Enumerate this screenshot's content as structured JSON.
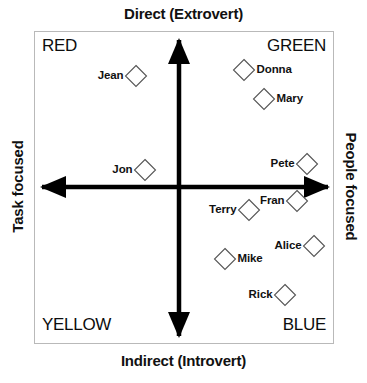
{
  "chart_data": {
    "type": "scatter",
    "title": "",
    "xlabel": "",
    "ylabel": "",
    "xlim": [
      0,
      367
    ],
    "ylim": [
      0,
      383
    ],
    "grid": false,
    "legend": "none",
    "axis_titles": {
      "top": "Direct (Extrovert)",
      "bottom": "Indirect (Introvert)",
      "left": "Task focused",
      "right": "People focused"
    },
    "quadrants": [
      {
        "name": "top-left",
        "label": "RED"
      },
      {
        "name": "top-right",
        "label": "GREEN"
      },
      {
        "name": "bottom-left",
        "label": "YELLOW"
      },
      {
        "name": "bottom-right",
        "label": "BLUE"
      }
    ],
    "origin": {
      "x": 179,
      "y": 187
    },
    "marker_shape": "diamond",
    "marker_size": 21,
    "points": [
      {
        "name": "Jean",
        "x": 136,
        "y": 76,
        "label_side": "left",
        "quadrant": "RED"
      },
      {
        "name": "Donna",
        "x": 244,
        "y": 70,
        "label_side": "right",
        "quadrant": "GREEN"
      },
      {
        "name": "Mary",
        "x": 264,
        "y": 99,
        "label_side": "right",
        "quadrant": "GREEN"
      },
      {
        "name": "Jon",
        "x": 145,
        "y": 170,
        "label_side": "left",
        "quadrant": "RED"
      },
      {
        "name": "Pete",
        "x": 307,
        "y": 164,
        "label_side": "left",
        "quadrant": "GREEN"
      },
      {
        "name": "Fran",
        "x": 297,
        "y": 201,
        "label_side": "left",
        "quadrant": "BLUE"
      },
      {
        "name": "Terry",
        "x": 249,
        "y": 210,
        "label_side": "left",
        "quadrant": "BLUE"
      },
      {
        "name": "Alice",
        "x": 314,
        "y": 246,
        "label_side": "left",
        "quadrant": "BLUE"
      },
      {
        "name": "Mike",
        "x": 225,
        "y": 259,
        "label_side": "right",
        "quadrant": "BLUE"
      },
      {
        "name": "Rick",
        "x": 285,
        "y": 295,
        "label_side": "left",
        "quadrant": "BLUE"
      }
    ]
  },
  "colors": {
    "axis": "#000000",
    "frame": "#b9b9b9",
    "marker_stroke": "#555555",
    "text": "#111111",
    "background": "#ffffff"
  }
}
